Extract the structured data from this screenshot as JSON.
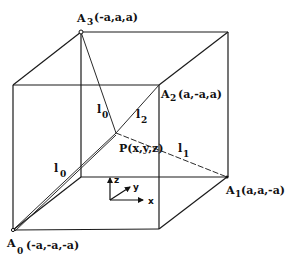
{
  "diagram": {
    "vertices": {
      "A0": {
        "name": "A",
        "sub": "0",
        "coords": "(-a,-a,-a)"
      },
      "A1": {
        "name": "A",
        "sub": "1",
        "coords": "(a,a,-a)"
      },
      "A2": {
        "name": "A",
        "sub": "2",
        "coords": "(a,-a,a)"
      },
      "A3": {
        "name": "A",
        "sub": "3",
        "coords": "(-a,a,a)"
      }
    },
    "point": {
      "label": "P(x,y,z)"
    },
    "distances": {
      "l0": {
        "name": "l",
        "sub": "0"
      },
      "l1": {
        "name": "l",
        "sub": "1"
      },
      "l2": {
        "name": "l",
        "sub": "2"
      },
      "l3": {
        "name": "l",
        "sub": "0"
      }
    },
    "axes": {
      "x": "x",
      "y": "y",
      "z": "z"
    }
  }
}
